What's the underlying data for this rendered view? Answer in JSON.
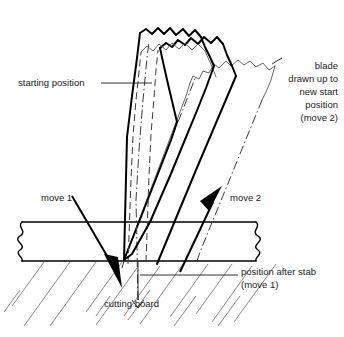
{
  "figure": {
    "background_color": "#ffffff",
    "ink_color": "#000000",
    "hatch_color": "#6b6b6b"
  },
  "labels": {
    "starting_position": "starting position",
    "blade_drawn_up": [
      "blade",
      "drawn up to",
      "new start",
      "position",
      "(move 2)"
    ],
    "move_1": "move 1",
    "move_2": "move 2",
    "position_after_stab": [
      "position after stab",
      "(move 1)"
    ],
    "cutting_board": "cutting board"
  },
  "elements": {
    "blade_start": "blade-outline-starting-position",
    "blade_mid": "blade-outline-dashed-intermediate",
    "blade_after_stab": "blade-outline-position-after-stab",
    "blade_new_start": "blade-outline-new-start-position",
    "board": "cutting-board-cross-section",
    "hatching": "material-hatching",
    "pivot": "blade-tip-pivot-point"
  }
}
